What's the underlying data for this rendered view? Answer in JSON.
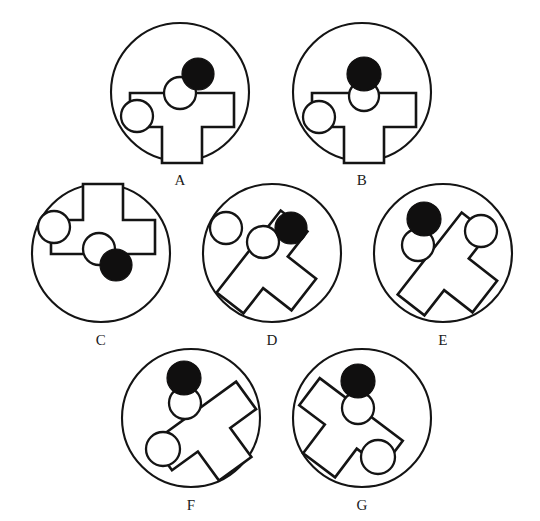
{
  "page": {
    "width": 540,
    "height": 521,
    "background_color": "#ffffff",
    "ink_color": "#141414",
    "filled_dot_color": "#100f0f",
    "open_dot_fill": "#ffffff"
  },
  "figures": [
    {
      "id": "A",
      "label": "A",
      "circle": {
        "cx": 180,
        "cy": 92,
        "r": 69
      },
      "label_pos": {
        "x": 180,
        "y": 185
      },
      "tee": {
        "cx": 182,
        "cy": 115,
        "rotation": 0,
        "scale": 1.0
      },
      "dots": [
        {
          "name": "filled-dot",
          "type": "filled",
          "cx": 198,
          "cy": 74,
          "r": 16
        },
        {
          "name": "open-dot-top",
          "type": "open",
          "cx": 180,
          "cy": 93,
          "r": 16
        },
        {
          "name": "open-dot-side",
          "type": "open",
          "cx": 137,
          "cy": 116,
          "r": 16
        }
      ]
    },
    {
      "id": "B",
      "label": "B",
      "circle": {
        "cx": 362,
        "cy": 92,
        "r": 69
      },
      "label_pos": {
        "x": 362,
        "y": 185
      },
      "tee": {
        "cx": 364,
        "cy": 115,
        "rotation": 0,
        "scale": 1.0
      },
      "dots": [
        {
          "name": "filled-dot",
          "type": "filled",
          "cx": 364,
          "cy": 74,
          "r": 17
        },
        {
          "name": "open-dot-top",
          "type": "open",
          "cx": 364,
          "cy": 96,
          "r": 15
        },
        {
          "name": "open-dot-side",
          "type": "open",
          "cx": 319,
          "cy": 117,
          "r": 16
        }
      ]
    },
    {
      "id": "C",
      "label": "C",
      "circle": {
        "cx": 101,
        "cy": 253,
        "r": 69
      },
      "label_pos": {
        "x": 101,
        "y": 345
      },
      "tee": {
        "cx": 103,
        "cy": 232,
        "rotation": 180,
        "scale": 1.0
      },
      "dots": [
        {
          "name": "filled-dot",
          "type": "filled",
          "cx": 116,
          "cy": 265,
          "r": 16
        },
        {
          "name": "open-dot-top",
          "type": "open",
          "cx": 99,
          "cy": 249,
          "r": 16
        },
        {
          "name": "open-dot-side",
          "type": "open",
          "cx": 54,
          "cy": 227,
          "r": 16
        }
      ]
    },
    {
      "id": "D",
      "label": "D",
      "circle": {
        "cx": 272,
        "cy": 253,
        "r": 69
      },
      "label_pos": {
        "x": 272,
        "y": 345
      },
      "tee": {
        "cx": 266,
        "cy": 265,
        "rotation": -52,
        "scale": 1.0
      },
      "dots": [
        {
          "name": "filled-dot",
          "type": "filled",
          "cx": 291,
          "cy": 228,
          "r": 16
        },
        {
          "name": "open-dot-top",
          "type": "open",
          "cx": 263,
          "cy": 242,
          "r": 16
        },
        {
          "name": "open-dot-side",
          "type": "open",
          "cx": 226,
          "cy": 228,
          "r": 16
        }
      ]
    },
    {
      "id": "E",
      "label": "E",
      "circle": {
        "cx": 443,
        "cy": 253,
        "r": 69
      },
      "label_pos": {
        "x": 443,
        "y": 345
      },
      "tee": {
        "cx": 447,
        "cy": 267,
        "rotation": -52,
        "scale": 1.0
      },
      "dots": [
        {
          "name": "filled-dot",
          "type": "filled",
          "cx": 424,
          "cy": 219,
          "r": 17
        },
        {
          "name": "open-dot-top",
          "type": "open",
          "cx": 418,
          "cy": 245,
          "r": 16
        },
        {
          "name": "open-dot-side",
          "type": "open",
          "cx": 481,
          "cy": 231,
          "r": 16
        }
      ]
    },
    {
      "id": "F",
      "label": "F",
      "circle": {
        "cx": 191,
        "cy": 418,
        "r": 69
      },
      "label_pos": {
        "x": 191,
        "y": 510
      },
      "tee": {
        "cx": 207,
        "cy": 430,
        "rotation": -36,
        "scale": 1.0
      },
      "dots": [
        {
          "name": "filled-dot",
          "type": "filled",
          "cx": 184,
          "cy": 378,
          "r": 17
        },
        {
          "name": "open-dot-top",
          "type": "open",
          "cx": 185,
          "cy": 403,
          "r": 16
        },
        {
          "name": "open-dot-side",
          "type": "open",
          "cx": 163,
          "cy": 449,
          "r": 17
        }
      ]
    },
    {
      "id": "G",
      "label": "G",
      "circle": {
        "cx": 362,
        "cy": 418,
        "r": 69
      },
      "label_pos": {
        "x": 362,
        "y": 510
      },
      "tee": {
        "cx": 348,
        "cy": 427,
        "rotation": 37,
        "scale": 1.0
      },
      "dots": [
        {
          "name": "filled-dot",
          "type": "filled",
          "cx": 358,
          "cy": 381,
          "r": 17
        },
        {
          "name": "open-dot-top",
          "type": "open",
          "cx": 358,
          "cy": 408,
          "r": 16
        },
        {
          "name": "open-dot-side",
          "type": "open",
          "cx": 378,
          "cy": 457,
          "r": 17
        }
      ]
    }
  ],
  "tee_shape": {
    "description": "T-shaped polygon: wide horizontal bar on top, narrow stem below",
    "points": "-52,-22 52,-22 52,12 20,12 20,48 -20,48 -20,12 -52,12"
  }
}
